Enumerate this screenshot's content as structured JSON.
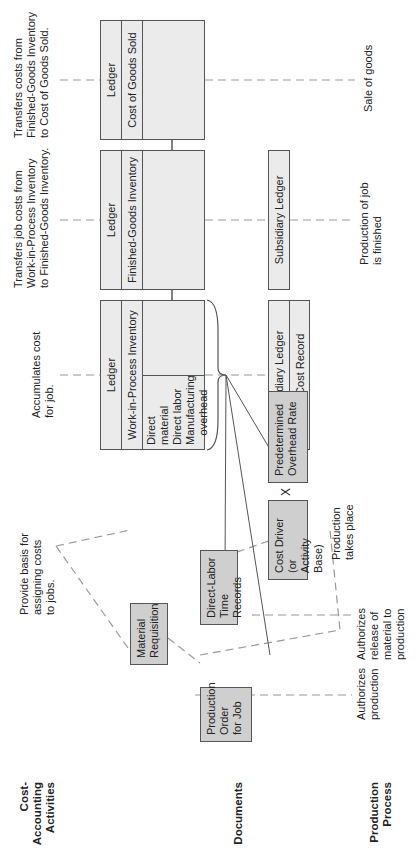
{
  "row_labels": {
    "cost_accounting": [
      "Cost-",
      "Accounting",
      "Activities"
    ],
    "documents": "Documents",
    "production_process": [
      "Production",
      "Process"
    ]
  },
  "annotations": {
    "cogs": [
      "Transfers costs from",
      "Finished-Goods Inventory",
      "to Cost of Goods Sold."
    ],
    "fg": [
      "Transfers job costs from",
      "Work-in-Process Inventory",
      "to Finished-Goods Inventory."
    ],
    "wip": [
      "Accumulates cost",
      "for job."
    ],
    "basis": [
      "Provide basis for",
      "assigning costs",
      "to jobs."
    ]
  },
  "ledgers": {
    "cogs": {
      "title": "Ledger",
      "account": "Cost of Goods Sold"
    },
    "fg": {
      "title": "Ledger",
      "account": "Finished-Goods Inventory"
    },
    "wip": {
      "title": "Ledger",
      "account": "Work-in-Process Inventory",
      "entries": [
        "Direct material",
        "Direct labor",
        "Manufacturing",
        "overhead"
      ]
    }
  },
  "subsidiary": {
    "fg": {
      "title": "Subsidiary Ledger"
    },
    "wip": {
      "title": "Subsidiary Ledger",
      "record": "Job-Cost Record"
    }
  },
  "documents": {
    "production_order": [
      "Production",
      "Order",
      "for Job"
    ],
    "material_requisition": [
      "Material",
      "Requisition"
    ],
    "direct_labor": [
      "Direct-Labor",
      "Time Records"
    ],
    "cost_driver": [
      "Cost Driver (or",
      "Activity Base)"
    ],
    "multiply": "X",
    "overhead_rate": [
      "Predetermined",
      "Overhead Rate"
    ]
  },
  "process": {
    "authorizes_production": [
      "Authorizes",
      "production"
    ],
    "authorizes_release": [
      "Authorizes",
      "release of",
      "material to",
      "production"
    ],
    "production_takes_place": [
      "Production",
      "takes place"
    ],
    "production_finished": [
      "Production of job",
      "is finished"
    ],
    "sale": "Sale of goods"
  },
  "colors": {
    "ledger_fill": "#ebebeb",
    "document_fill": "#cfcfcf",
    "line": "#555555",
    "dash": "#9a9a9a"
  }
}
